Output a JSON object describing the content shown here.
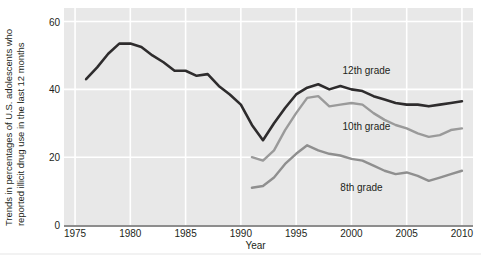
{
  "chart_data": {
    "type": "line",
    "title": "",
    "xlabel": "Year",
    "ylabel_line1": "Trends in percentages of U.S. adolescents who",
    "ylabel_line2": "reported illicit drug use in the last 12 months",
    "xlim": [
      1974,
      2011
    ],
    "ylim": [
      0,
      64
    ],
    "yticks": [
      0,
      20,
      40,
      60
    ],
    "xticks": [
      1975,
      1980,
      1985,
      1990,
      1995,
      2000,
      2005,
      2010
    ],
    "grid": true,
    "legend_position": "inline-right",
    "plot_background": "#e8e8e8",
    "gridline_color": "#ffffff",
    "series": [
      {
        "name": "12th grade",
        "color": "#2e2c2d",
        "label_x": 1999.2,
        "label_y": 45.0,
        "x": [
          1976,
          1977,
          1978,
          1979,
          1980,
          1981,
          1982,
          1983,
          1984,
          1985,
          1986,
          1987,
          1988,
          1989,
          1990,
          1991,
          1992,
          1993,
          1994,
          1995,
          1996,
          1997,
          1998,
          1999,
          2000,
          2001,
          2002,
          2003,
          2004,
          2005,
          2006,
          2007,
          2008,
          2009,
          2010
        ],
        "values": [
          43.0,
          46.5,
          50.5,
          53.5,
          53.5,
          52.5,
          50.0,
          48.0,
          45.5,
          45.5,
          44.0,
          44.5,
          41.0,
          38.5,
          35.5,
          29.5,
          25.0,
          30.0,
          34.5,
          38.5,
          40.5,
          41.5,
          40.0,
          41.0,
          40.0,
          39.5,
          38.0,
          37.0,
          36.0,
          35.5,
          35.5,
          35.0,
          35.5,
          36.0,
          36.5
        ],
        "start_year": 1976,
        "end_year": 2010
      },
      {
        "name": "10th grade",
        "color": "#9a9a9a",
        "label_x": 1999.2,
        "label_y": 28.5,
        "x": [
          1991,
          1992,
          1993,
          1994,
          1995,
          1996,
          1997,
          1998,
          1999,
          2000,
          2001,
          2002,
          2003,
          2004,
          2005,
          2006,
          2007,
          2008,
          2009,
          2010
        ],
        "values": [
          20.0,
          19.0,
          22.0,
          28.0,
          33.0,
          37.5,
          38.0,
          35.0,
          35.5,
          36.0,
          35.5,
          33.0,
          31.0,
          29.5,
          28.5,
          27.0,
          26.0,
          26.5,
          28.0,
          28.5
        ],
        "start_year": 1991,
        "end_year": 2010
      },
      {
        "name": "8th grade",
        "color": "#8f8f8f",
        "label_x": 1999.0,
        "label_y": 10.5,
        "x": [
          1991,
          1992,
          1993,
          1994,
          1995,
          1996,
          1997,
          1998,
          1999,
          2000,
          2001,
          2002,
          2003,
          2004,
          2005,
          2006,
          2007,
          2008,
          2009,
          2010
        ],
        "values": [
          11.0,
          11.5,
          14.0,
          18.0,
          21.0,
          23.5,
          22.0,
          21.0,
          20.5,
          19.5,
          19.0,
          17.5,
          16.0,
          15.0,
          15.5,
          14.5,
          13.0,
          14.0,
          15.0,
          16.0
        ],
        "start_year": 1991,
        "end_year": 2010
      }
    ]
  }
}
